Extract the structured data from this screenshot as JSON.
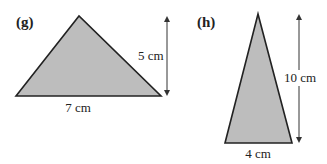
{
  "figures": [
    {
      "id": "g",
      "label": "(g)",
      "base_label": "7 cm",
      "height_label": "5 cm",
      "base_cm": 7,
      "height_cm": 5,
      "fill": "#bdbdbd",
      "stroke": "#222222"
    },
    {
      "id": "h",
      "label": "(h)",
      "base_label": "4 cm",
      "height_label": "10 cm",
      "base_cm": 4,
      "height_cm": 10,
      "fill": "#bdbdbd",
      "stroke": "#222222"
    }
  ]
}
